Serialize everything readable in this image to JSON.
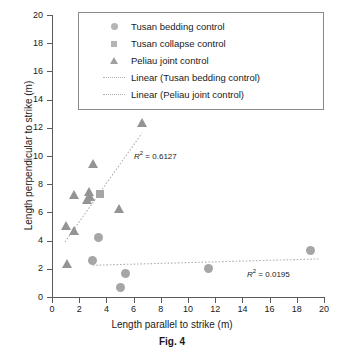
{
  "figure": {
    "caption": "Fig. 4"
  },
  "chart_data": {
    "type": "scatter",
    "title": "",
    "xlabel": "Length parallel to strike (m)",
    "ylabel": "Length perpendicular to strike (m)",
    "xlim": [
      0,
      20
    ],
    "ylim": [
      0,
      20
    ],
    "xticks": [
      0,
      2,
      4,
      6,
      8,
      10,
      12,
      14,
      16,
      18,
      20
    ],
    "yticks": [
      0,
      2,
      4,
      6,
      8,
      10,
      12,
      14,
      16,
      18,
      20
    ],
    "xtick_labels": [
      "0",
      "2",
      "4",
      "6",
      "8",
      "10",
      "12",
      "14",
      "16",
      "18",
      "20"
    ],
    "ytick_labels": [
      "0",
      "2",
      "4",
      "6",
      "8",
      "10",
      "12",
      "14",
      "16",
      "18",
      "20"
    ],
    "grid": false,
    "legend_position": "top-right-inside",
    "marker_color": "#a6a6a6",
    "trendline_color": "#b0b0b0",
    "axis_color": "#5a5a5a",
    "series": [
      {
        "name": "Tusan bedding control",
        "marker": "circle",
        "color": "#a6a6a6",
        "points": [
          {
            "x": 3.0,
            "y": 2.6
          },
          {
            "x": 3.4,
            "y": 4.2
          },
          {
            "x": 5.0,
            "y": 0.65
          },
          {
            "x": 5.4,
            "y": 1.7
          },
          {
            "x": 11.5,
            "y": 2.0
          },
          {
            "x": 19.0,
            "y": 3.3
          }
        ]
      },
      {
        "name": "Tusan collapse control",
        "marker": "square",
        "color": "#a6a6a6",
        "points": [
          {
            "x": 3.5,
            "y": 7.3
          }
        ]
      },
      {
        "name": "Peliau joint control",
        "marker": "triangle",
        "color": "#949494",
        "points": [
          {
            "x": 1.0,
            "y": 5.1
          },
          {
            "x": 1.1,
            "y": 2.35
          },
          {
            "x": 1.6,
            "y": 4.75
          },
          {
            "x": 1.65,
            "y": 7.25
          },
          {
            "x": 2.6,
            "y": 6.95
          },
          {
            "x": 2.75,
            "y": 7.5
          },
          {
            "x": 2.8,
            "y": 7.1
          },
          {
            "x": 3.0,
            "y": 9.5
          },
          {
            "x": 4.9,
            "y": 6.25
          },
          {
            "x": 6.6,
            "y": 12.4
          }
        ]
      }
    ],
    "trendlines": [
      {
        "name": "Linear (Tusan bedding control)",
        "style": "dotted",
        "color": "#b0b0b0",
        "x_start": 3.0,
        "y_start": 2.25,
        "x_end": 19.6,
        "y_end": 2.7,
        "r_squared": "0.0195",
        "r2_text": "= 0.0195"
      },
      {
        "name": "Linear (Peliau joint control)",
        "style": "dotted",
        "color": "#b0b0b0",
        "x_start": 0.95,
        "y_start": 3.9,
        "x_end": 6.6,
        "y_end": 11.6,
        "r_squared": "0.6127",
        "r2_text": "= 0.6127"
      }
    ],
    "annotations": [
      {
        "text": "R² = 0.6127",
        "symbol": "R",
        "sup": "2",
        "rest": "= 0.6127",
        "x_px": 134,
        "y_px": 150
      },
      {
        "text": "R² = 0.0195",
        "symbol": "R",
        "sup": "2",
        "rest": "= 0.0195",
        "x_px": 247,
        "y_px": 268
      }
    ]
  },
  "legend": {
    "items": [
      {
        "key": "circle",
        "label": "Tusan bedding control"
      },
      {
        "key": "square",
        "label": "Tusan collapse control"
      },
      {
        "key": "triangle",
        "label": "Peliau joint control"
      },
      {
        "key": "line",
        "label": "Linear (Tusan bedding control)"
      },
      {
        "key": "line",
        "label": "Linear (Peliau joint control)"
      }
    ]
  }
}
